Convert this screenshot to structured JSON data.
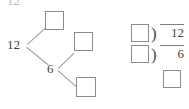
{
  "page": {
    "kind": "math-worksheet-figure",
    "background_color": "#ffffff",
    "ink_color": "#3f3f3f",
    "box_border_color": "#8b8b8b",
    "line_color": "#9a9a9a"
  },
  "top_cropped_label": {
    "text": "12",
    "note": "partially cut off at top edge"
  },
  "factor_tree": {
    "root_label": "12",
    "branch_node_label": "6",
    "answer_boxes": [
      {
        "id": "tree-box-top",
        "value": ""
      },
      {
        "id": "tree-box-middle",
        "value": ""
      },
      {
        "id": "tree-box-bottom",
        "value": ""
      }
    ]
  },
  "division_problems": [
    {
      "id": "division-row-1",
      "divisor": "",
      "symbol": ")",
      "dividend": "12"
    },
    {
      "id": "division-row-2",
      "divisor": "",
      "symbol": ")",
      "dividend": "6"
    }
  ],
  "final_answer_box": {
    "id": "final-answer-box",
    "value": ""
  }
}
